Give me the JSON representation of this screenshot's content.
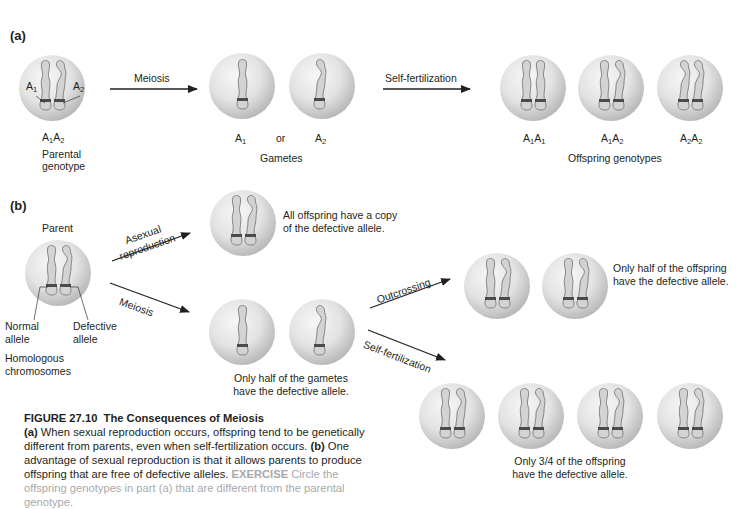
{
  "figure": {
    "number": "FIGURE 27.10",
    "title": "The Consequences of Meiosis"
  },
  "part_a": {
    "label": "(a)",
    "parent": {
      "allele_left": {
        "base": "A",
        "sub": "1"
      },
      "allele_right": {
        "base": "A",
        "sub": "2"
      },
      "genotype": {
        "g1": {
          "base": "A",
          "sub": "1"
        },
        "g2": {
          "base": "A",
          "sub": "2"
        }
      },
      "caption_line1": "Parental",
      "caption_line2": "genotype"
    },
    "arrow_meiosis": "Meiosis",
    "gametes": {
      "items": [
        {
          "base": "A",
          "sub": "1"
        },
        {
          "base": "A",
          "sub": "2"
        }
      ],
      "separator": "or",
      "caption": "Gametes"
    },
    "arrow_self_fertilization": "Self-fertilization",
    "offspring": {
      "items": [
        {
          "a": "A",
          "a_sub": "1",
          "b": "A",
          "b_sub": "1"
        },
        {
          "a": "A",
          "a_sub": "1",
          "b": "A",
          "b_sub": "2"
        },
        {
          "a": "A",
          "a_sub": "2",
          "b": "A",
          "b_sub": "2"
        }
      ],
      "caption": "Offspring genotypes"
    }
  },
  "part_b": {
    "label": "(b)",
    "parent_label": "Parent",
    "normal_allele": {
      "line1": "Normal",
      "line2": "allele"
    },
    "defective_allele": {
      "line1": "Defective",
      "line2": "allele"
    },
    "homologous": {
      "line1": "Homologous",
      "line2": "chromosomes"
    },
    "arrow_asexual": {
      "line1": "Asexual",
      "line2": "reproduction"
    },
    "arrow_meiosis": "Meiosis",
    "asexual_result": {
      "line1": "All offspring have a copy",
      "line2": "of the defective allele."
    },
    "gametes_result": {
      "line1": "Only half of the gametes",
      "line2": "have the defective allele."
    },
    "arrow_outcrossing": "Outcrossing",
    "arrow_self_fertilization": "Self-fertilization",
    "outcrossing_result": {
      "line1": "Only half of the offspring",
      "line2": "have the defective allele."
    },
    "self_fert_result": {
      "line1": "Only 3/4 of the offspring",
      "line2": "have the defective allele."
    }
  },
  "caption": {
    "a_tag": "(a)",
    "a_text": " When sexual reproduction occurs, offspring tend to be genetically different from parents, even when self-fertilization occurs. ",
    "b_tag": "(b)",
    "b_text": " One advantage of sexual reproduction is that it allows parents to produce offspring that are free of defective alleles. ",
    "exercise_key": "EXERCISE",
    "exercise_text": " Circle the offspring genotypes in part (a) that are different from the parental genotype."
  },
  "colors": {
    "cell_light": "#f2f2f2",
    "cell_dark": "#b9b9b9",
    "chromosome_fill": "#cfcfcf",
    "chromosome_stroke": "#7a7a7a",
    "band": "#4a4a4a",
    "text": "#231f20",
    "exercise": "#a7a9ac"
  }
}
